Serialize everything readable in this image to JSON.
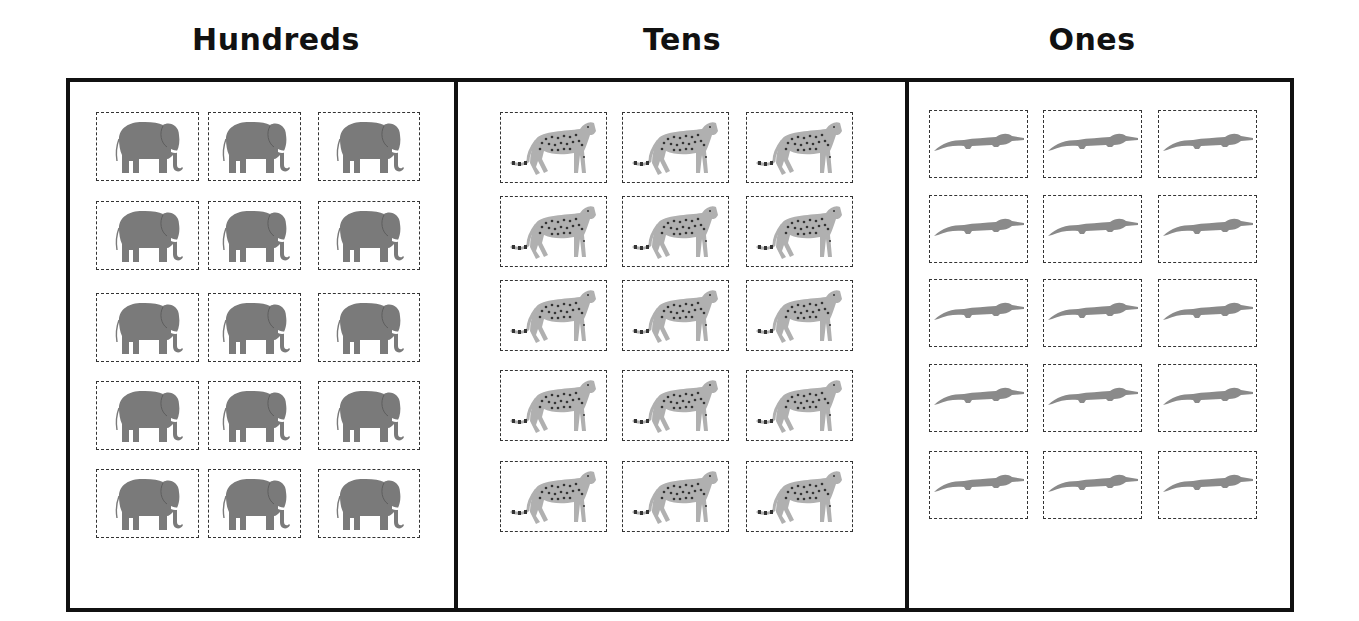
{
  "headings": {
    "hundreds": "Hundreds",
    "tens": "Tens",
    "ones": "Ones"
  },
  "columns": [
    {
      "name": "hundreds",
      "animal": "elephant-icon",
      "rows": 5,
      "cols": 3,
      "count": 15,
      "fill": "#7a7a7a"
    },
    {
      "name": "tens",
      "animal": "cheetah-icon",
      "rows": 5,
      "cols": 3,
      "count": 15,
      "fill": "#b0b0b0"
    },
    {
      "name": "ones",
      "animal": "crocodile-icon",
      "rows": 5,
      "cols": 3,
      "count": 15,
      "fill": "#8a8a8a"
    }
  ],
  "colors": {
    "frame": "#111111",
    "dashed_border": "#333333",
    "background": "#ffffff"
  }
}
